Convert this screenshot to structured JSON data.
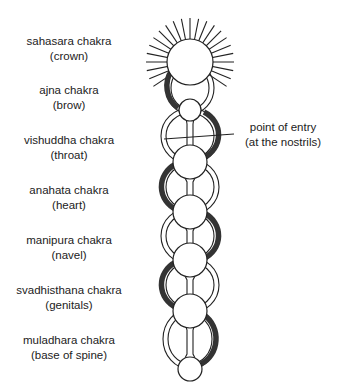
{
  "diagram": {
    "chakras": [
      {
        "name": "sahasara chakra",
        "location": "(crown)",
        "label_x": 69,
        "label_y": 34
      },
      {
        "name": "ajna chakra",
        "location": "(brow)",
        "label_x": 69,
        "label_y": 83
      },
      {
        "name": "vishuddha chakra",
        "location": "(throat)",
        "label_x": 69,
        "label_y": 133
      },
      {
        "name": "anahata chakra",
        "location": "(heart)",
        "label_x": 69,
        "label_y": 183
      },
      {
        "name": "manipura chakra",
        "location": "(navel)",
        "label_x": 69,
        "label_y": 233
      },
      {
        "name": "svadhisthana chakra",
        "location": "(genitals)",
        "label_x": 69,
        "label_y": 283
      },
      {
        "name": "muladhara chakra",
        "location": "(base of spine)",
        "label_x": 69,
        "label_y": 333
      }
    ],
    "annotation": {
      "line1": "point of entry",
      "line2": "(at the nostrils)",
      "label_x": 283,
      "label_y": 120
    },
    "colors": {
      "ink": "#222222",
      "background": "#ffffff",
      "dark_channel": "#333333"
    }
  }
}
